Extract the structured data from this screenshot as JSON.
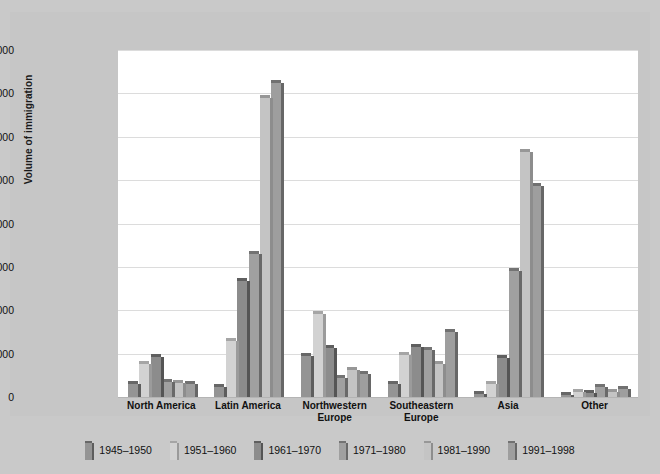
{
  "chart_data": {
    "type": "bar",
    "title": "",
    "xlabel": "",
    "ylabel": "Volume of immigration",
    "ylim": [
      0,
      4000000
    ],
    "ytick_labels": [
      "0",
      "500,000",
      "1,000,000",
      "1,500,000",
      "2,000,000",
      "2,500,000",
      "3,000,000",
      "3,500,000",
      "4,000,000"
    ],
    "ytick_values": [
      0,
      500000,
      1000000,
      1500000,
      2000000,
      2500000,
      3000000,
      3500000,
      4000000
    ],
    "grid": true,
    "legend_position": "bottom",
    "categories": [
      "North America",
      "Latin America",
      "Northwestern Europe",
      "Southeastern Europe",
      "Asia",
      "Other"
    ],
    "series": [
      {
        "name": "1945–1950",
        "color": "#949494",
        "values": [
          155000,
          120000,
          470000,
          145000,
          35000,
          25000
        ]
      },
      {
        "name": "1951–1960",
        "color": "#d2d2d2",
        "values": [
          380000,
          650000,
          960000,
          480000,
          150000,
          55000
        ]
      },
      {
        "name": "1961–1970",
        "color": "#8c8c8c",
        "values": [
          460000,
          1340000,
          560000,
          580000,
          445000,
          50000
        ]
      },
      {
        "name": "1971–1980",
        "color": "#a0a0a0",
        "values": [
          175000,
          1650000,
          215000,
          540000,
          1450000,
          110000
        ]
      },
      {
        "name": "1981–1990",
        "color": "#c4c4c4",
        "values": [
          160000,
          3450000,
          310000,
          375000,
          2820000,
          60000
        ]
      },
      {
        "name": "1991–1998",
        "color": "#9e9e9e",
        "values": [
          145000,
          3620000,
          260000,
          745000,
          2430000,
          95000
        ]
      }
    ]
  },
  "legend": {
    "items": [
      {
        "label": "1945–1950"
      },
      {
        "label": "1951–1960"
      },
      {
        "label": "1961–1970"
      },
      {
        "label": "1971–1980"
      },
      {
        "label": "1981–1990"
      },
      {
        "label": "1991–1998"
      }
    ]
  },
  "colors": {
    "figure_background": "#c9c9c9",
    "plot_background": "#ffffff",
    "gridline": "#dcdcdc",
    "text": "#111111"
  }
}
